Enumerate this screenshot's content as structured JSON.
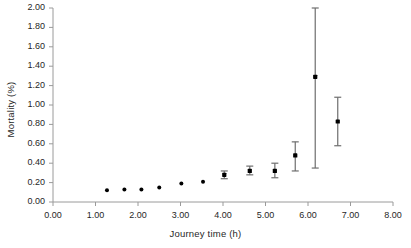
{
  "chart_data": {
    "type": "scatter",
    "title": "",
    "xlabel": "Journey time (h)",
    "ylabel": "Mortality (%)",
    "xlim": [
      0.0,
      8.0
    ],
    "ylim": [
      0.0,
      2.0
    ],
    "xticks": [
      "0.00",
      "1.00",
      "2.00",
      "3.00",
      "4.00",
      "5.00",
      "6.00",
      "7.00",
      "8.00"
    ],
    "yticks": [
      "0.00",
      "0.20",
      "0.40",
      "0.60",
      "0.80",
      "1.00",
      "1.20",
      "1.40",
      "1.60",
      "1.80",
      "2.00"
    ],
    "xtick_values": [
      0,
      1,
      2,
      3,
      4,
      5,
      6,
      7,
      8
    ],
    "ytick_values": [
      0,
      0.2,
      0.4,
      0.6,
      0.8,
      1.0,
      1.2,
      1.4,
      1.6,
      1.8,
      2.0
    ],
    "grid": false,
    "legend": null,
    "marker_color": "#000000",
    "errorbar_color": "#6e6e6e",
    "axis_color": "#9a9a9a",
    "x": [
      1.27,
      1.68,
      2.08,
      2.5,
      3.02,
      3.53,
      4.03,
      4.27,
      4.63,
      5.22,
      5.7,
      6.17,
      6.7
    ],
    "y": [
      0.12,
      0.13,
      0.13,
      0.15,
      0.19,
      0.21,
      0.28,
      0.28,
      0.32,
      0.32,
      0.48,
      1.29,
      0.83
    ],
    "series": [
      {
        "name": "Mortality vs journey time",
        "points": [
          {
            "x": 1.27,
            "y": 0.12,
            "ylow": 0.12,
            "yhigh": 0.12
          },
          {
            "x": 1.68,
            "y": 0.13,
            "ylow": 0.13,
            "yhigh": 0.13
          },
          {
            "x": 2.08,
            "y": 0.13,
            "ylow": 0.13,
            "yhigh": 0.13
          },
          {
            "x": 2.5,
            "y": 0.15,
            "ylow": 0.15,
            "yhigh": 0.15
          },
          {
            "x": 3.02,
            "y": 0.19,
            "ylow": 0.19,
            "yhigh": 0.19
          },
          {
            "x": 3.53,
            "y": 0.21,
            "ylow": 0.21,
            "yhigh": 0.21
          },
          {
            "x": 4.03,
            "y": 0.28,
            "ylow": 0.24,
            "yhigh": 0.32
          },
          {
            "x": 4.63,
            "y": 0.32,
            "ylow": 0.28,
            "yhigh": 0.37
          },
          {
            "x": 5.22,
            "y": 0.32,
            "ylow": 0.25,
            "yhigh": 0.4
          },
          {
            "x": 5.7,
            "y": 0.48,
            "ylow": 0.32,
            "yhigh": 0.62
          },
          {
            "x": 6.17,
            "y": 1.29,
            "ylow": 0.35,
            "yhigh": 2.0
          },
          {
            "x": 6.7,
            "y": 0.83,
            "ylow": 0.58,
            "yhigh": 1.08
          }
        ]
      }
    ]
  }
}
